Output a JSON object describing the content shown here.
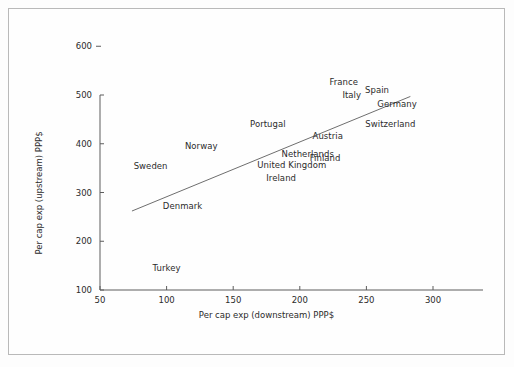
{
  "chart_data": {
    "type": "scatter",
    "title": "",
    "xlabel": "Per cap exp (downstream) PPP$",
    "ylabel": "Per cap exp (upstream) PPP$",
    "xlim": [
      50,
      300
    ],
    "ylim": [
      100,
      600
    ],
    "xticks": [
      50,
      100,
      150,
      200,
      250,
      300
    ],
    "yticks": [
      100,
      200,
      300,
      400,
      500,
      600
    ],
    "xtick_labels": [
      "50",
      "100",
      "150",
      "200",
      "250",
      "300"
    ],
    "ytick_labels": [
      "100",
      "200",
      "300",
      "400",
      "500",
      "600"
    ],
    "grid": false,
    "legend": "none",
    "marker_style": "text-label-only",
    "point_label_field": "country",
    "points": [
      {
        "country": "Turkey",
        "x": 100,
        "y": 145
      },
      {
        "country": "Denmark",
        "x": 112,
        "y": 272
      },
      {
        "country": "Sweden",
        "x": 88,
        "y": 355
      },
      {
        "country": "Norway",
        "x": 126,
        "y": 396
      },
      {
        "country": "Portugal",
        "x": 176,
        "y": 441
      },
      {
        "country": "Ireland",
        "x": 186,
        "y": 330
      },
      {
        "country": "United Kingdom",
        "x": 194,
        "y": 356
      },
      {
        "country": "Netherlands",
        "x": 206,
        "y": 380
      },
      {
        "country": "Finland",
        "x": 219,
        "y": 370
      },
      {
        "country": "Austria",
        "x": 221,
        "y": 415
      },
      {
        "country": "France",
        "x": 233,
        "y": 527
      },
      {
        "country": "Italy",
        "x": 239,
        "y": 500
      },
      {
        "country": "Spain",
        "x": 258,
        "y": 511
      },
      {
        "country": "Switzerland",
        "x": 268,
        "y": 441
      },
      {
        "country": "Germany",
        "x": 273,
        "y": 481
      }
    ],
    "trend_line": {
      "type": "linear-fit",
      "x_start": 74,
      "y_start": 262,
      "x_end": 283,
      "y_end": 497
    },
    "colors": {
      "text": "#2b2b2b",
      "axis": "#5c5c5c",
      "trend_line": "#6e6e6e",
      "frame": "#b9b9b9",
      "background": "#fefefe"
    }
  }
}
